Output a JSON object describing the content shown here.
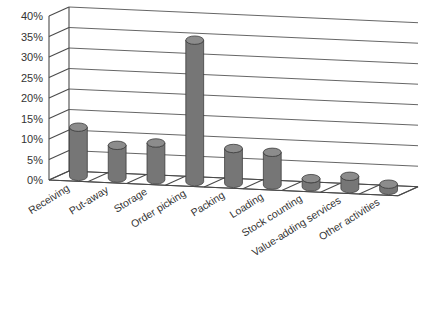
{
  "chart_data": {
    "type": "bar",
    "title": "",
    "subtitle": "",
    "xlabel": "",
    "ylabel": "",
    "ylim": [
      0,
      40
    ],
    "ytick_step": 5,
    "ytick_labels": [
      "0%",
      "5%",
      "10%",
      "15%",
      "20%",
      "25%",
      "30%",
      "35%",
      "40%"
    ],
    "grid": true,
    "legend": "none",
    "three_d": true,
    "bar_style": "cylinder",
    "value_unit": "%",
    "categories": [
      "Receiving",
      "Put-away",
      "Storage",
      "Order picking",
      "Packing",
      "Loading",
      "Stock counting",
      "Value-adding services",
      "Other activities"
    ],
    "values": [
      12,
      8,
      9,
      34.5,
      8.5,
      8,
      2,
      3,
      1.5
    ],
    "colors": {
      "bar_fill": "#767676",
      "bar_top": "#8c8c8c",
      "bar_outline": "#3e3e3e",
      "grid": "#555555",
      "axis": "#4a4a4a",
      "background": "#ffffff",
      "text": "#333333"
    }
  }
}
